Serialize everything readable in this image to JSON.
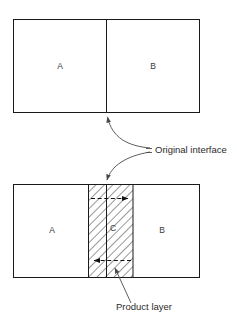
{
  "figure": {
    "title": "",
    "background_color": "#ffffff",
    "line_color": "#1a1a1a",
    "hatch_color": "#1a1a1a",
    "label_color": "#3a3a3a",
    "callout_color": "#2b2b2b"
  },
  "panels": {
    "top": {
      "name": "before-reaction",
      "regions": [
        {
          "id": "A",
          "label": "A",
          "fill": "none"
        },
        {
          "id": "B",
          "label": "B",
          "fill": "none"
        }
      ],
      "divider": {
        "label": "",
        "kind": "original-interface"
      }
    },
    "bottom": {
      "name": "after-reaction",
      "regions": [
        {
          "id": "A",
          "label": "A",
          "fill": "none"
        },
        {
          "id": "C",
          "label": "C",
          "fill": "hatched"
        },
        {
          "id": "B",
          "label": "B",
          "fill": "none"
        }
      ],
      "divider": {
        "label": "",
        "kind": "original-interface"
      },
      "arrows": [
        {
          "id": "upper-flux",
          "direction": "right",
          "style": "dashed"
        },
        {
          "id": "lower-flux",
          "direction": "left",
          "style": "dashed"
        }
      ]
    }
  },
  "callouts": [
    {
      "id": "original-interface",
      "label": "Original interface",
      "targets": [
        "top-divider",
        "bottom-divider"
      ]
    },
    {
      "id": "product-layer",
      "label": "Product layer",
      "targets": [
        "hatched-region"
      ]
    }
  ]
}
